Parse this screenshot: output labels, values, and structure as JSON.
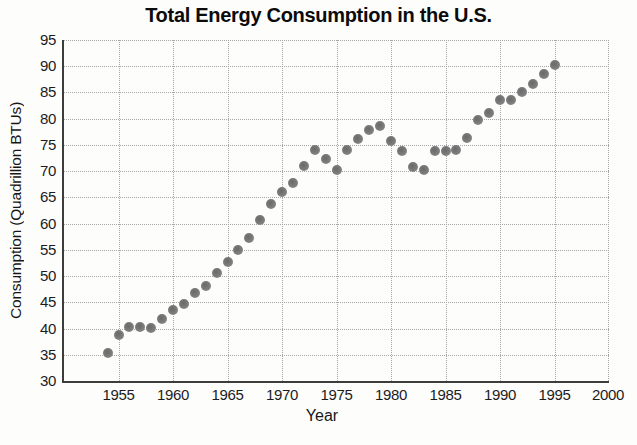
{
  "page": {
    "background": "#fdfdfc"
  },
  "colors": {
    "title_text": "#0b0b0b",
    "axis_line": "#3d3d3d",
    "gridline": "#a6a6a6",
    "marker": "#7d7d7d",
    "tick_text": "#1c1c1c"
  },
  "chart_data": {
    "type": "scatter",
    "title": "Total Energy Consumption in the U.S.",
    "xlabel": "Year",
    "ylabel": "Consumption (Quadrillion BTUs)",
    "xlim": [
      1950,
      2000
    ],
    "ylim": [
      30,
      95
    ],
    "x_ticks": [
      1955,
      1960,
      1965,
      1970,
      1975,
      1980,
      1985,
      1990,
      1995,
      2000
    ],
    "y_ticks": [
      30,
      35,
      40,
      45,
      50,
      55,
      60,
      65,
      70,
      75,
      80,
      85,
      90,
      95
    ],
    "grid": "dotted-both-axes",
    "legend": "none",
    "series": [
      {
        "name": "Total energy consumption (Quadrillion BTUs)",
        "marker": "circle",
        "color": "#7d7d7d",
        "points": [
          [
            1954,
            35.3
          ],
          [
            1955,
            38.8
          ],
          [
            1956,
            40.3
          ],
          [
            1957,
            40.3
          ],
          [
            1958,
            40.1
          ],
          [
            1959,
            41.8
          ],
          [
            1960,
            43.6
          ],
          [
            1961,
            44.7
          ],
          [
            1962,
            46.8
          ],
          [
            1963,
            48.2
          ],
          [
            1964,
            50.5
          ],
          [
            1965,
            52.6
          ],
          [
            1966,
            55.0
          ],
          [
            1967,
            57.3
          ],
          [
            1968,
            60.7
          ],
          [
            1969,
            63.8
          ],
          [
            1970,
            66.1
          ],
          [
            1971,
            67.8
          ],
          [
            1972,
            71.0
          ],
          [
            1973,
            74.0
          ],
          [
            1974,
            72.4
          ],
          [
            1975,
            70.3
          ],
          [
            1976,
            74.0
          ],
          [
            1977,
            76.1
          ],
          [
            1978,
            77.8
          ],
          [
            1979,
            78.7
          ],
          [
            1980,
            75.8
          ],
          [
            1981,
            73.9
          ],
          [
            1982,
            70.7
          ],
          [
            1983,
            70.2
          ],
          [
            1984,
            73.8
          ],
          [
            1985,
            73.8
          ],
          [
            1986,
            74.0
          ],
          [
            1987,
            76.4
          ],
          [
            1988,
            79.7
          ],
          [
            1989,
            81.0
          ],
          [
            1990,
            83.6
          ],
          [
            1991,
            83.5
          ],
          [
            1992,
            85.0
          ],
          [
            1993,
            86.7
          ],
          [
            1994,
            88.5
          ],
          [
            1995,
            90.3
          ]
        ]
      }
    ]
  }
}
